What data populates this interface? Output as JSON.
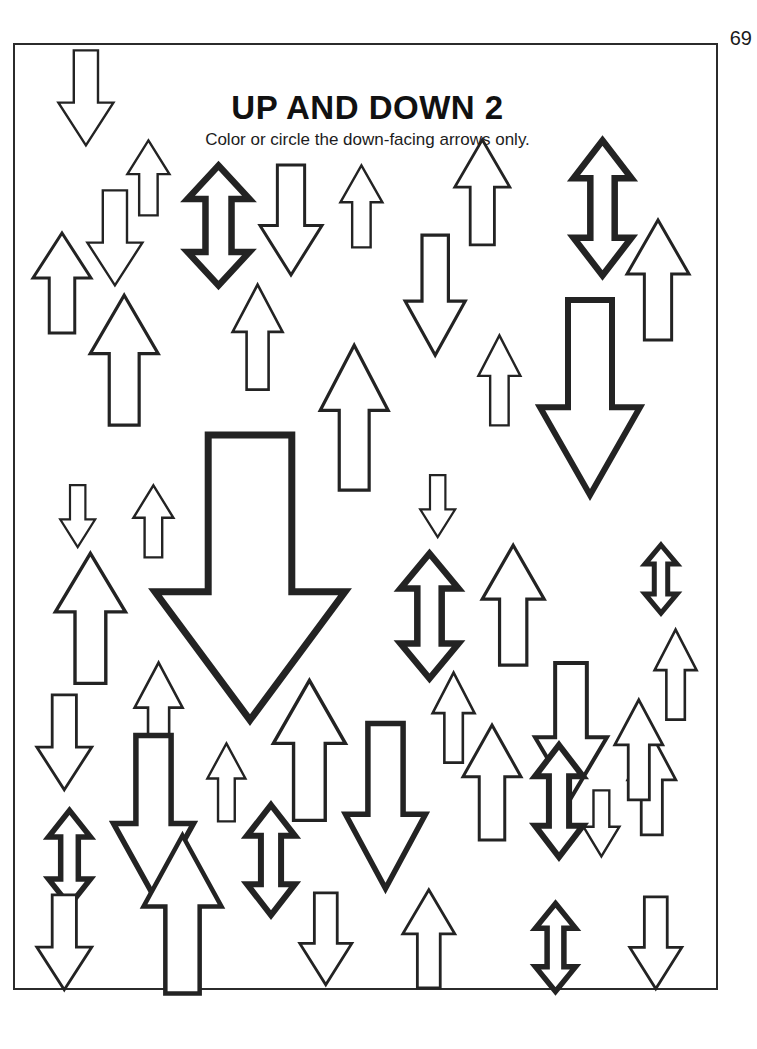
{
  "page": {
    "number": "69",
    "title": "UP AND DOWN 2",
    "subtitle": "Color or circle the down-facing arrows only.",
    "border_color": "#2b2b2b",
    "ink_color": "#232323",
    "paper_color": "#ffffff"
  },
  "worksheet": {
    "instruction_task": "Color or circle the down-facing arrows only.",
    "arrow_kinds": [
      "up",
      "down",
      "double"
    ],
    "stroke_weights": {
      "thin": 2.4,
      "bold": 6.5
    },
    "counts": {
      "up": 30,
      "down": 24,
      "double": 7,
      "total": 61
    },
    "arrows": [
      {
        "name": "arrow-down-01",
        "dir": "down",
        "x": 43,
        "y": 5,
        "w": 55,
        "h": 95,
        "stroke": 2.4
      },
      {
        "name": "arrow-up-02",
        "dir": "up",
        "x": 112,
        "y": 95,
        "w": 42,
        "h": 75,
        "stroke": 2.4
      },
      {
        "name": "arrow-down-03",
        "dir": "down",
        "x": 72,
        "y": 145,
        "w": 55,
        "h": 95,
        "stroke": 2.4
      },
      {
        "name": "arrow-up-04",
        "dir": "up",
        "x": 18,
        "y": 188,
        "w": 58,
        "h": 100,
        "stroke": 3.0
      },
      {
        "name": "arrow-double-05",
        "dir": "double",
        "x": 172,
        "y": 120,
        "w": 62,
        "h": 120,
        "stroke": 6.5
      },
      {
        "name": "arrow-down-06",
        "dir": "down",
        "x": 245,
        "y": 120,
        "w": 62,
        "h": 110,
        "stroke": 3.0
      },
      {
        "name": "arrow-up-07",
        "dir": "up",
        "x": 325,
        "y": 120,
        "w": 42,
        "h": 82,
        "stroke": 2.4
      },
      {
        "name": "arrow-up-08",
        "dir": "up",
        "x": 440,
        "y": 95,
        "w": 55,
        "h": 105,
        "stroke": 2.8
      },
      {
        "name": "arrow-double-09",
        "dir": "double",
        "x": 558,
        "y": 95,
        "w": 58,
        "h": 135,
        "stroke": 6.5
      },
      {
        "name": "arrow-up-10",
        "dir": "up",
        "x": 612,
        "y": 175,
        "w": 62,
        "h": 120,
        "stroke": 3.0
      },
      {
        "name": "arrow-up-11",
        "dir": "up",
        "x": 75,
        "y": 250,
        "w": 68,
        "h": 130,
        "stroke": 3.2
      },
      {
        "name": "arrow-up-12",
        "dir": "up",
        "x": 218,
        "y": 240,
        "w": 50,
        "h": 105,
        "stroke": 2.6
      },
      {
        "name": "arrow-down-13",
        "dir": "down",
        "x": 390,
        "y": 190,
        "w": 60,
        "h": 120,
        "stroke": 3.2
      },
      {
        "name": "arrow-up-14",
        "dir": "up",
        "x": 305,
        "y": 300,
        "w": 68,
        "h": 145,
        "stroke": 3.2
      },
      {
        "name": "arrow-up-15",
        "dir": "up",
        "x": 463,
        "y": 290,
        "w": 42,
        "h": 90,
        "stroke": 2.4
      },
      {
        "name": "arrow-down-16",
        "dir": "down",
        "x": 525,
        "y": 255,
        "w": 100,
        "h": 195,
        "stroke": 6.0
      },
      {
        "name": "arrow-down-17",
        "dir": "down",
        "x": 45,
        "y": 440,
        "w": 35,
        "h": 62,
        "stroke": 2.2
      },
      {
        "name": "arrow-up-18",
        "dir": "up",
        "x": 118,
        "y": 440,
        "w": 40,
        "h": 72,
        "stroke": 2.4
      },
      {
        "name": "arrow-down-19",
        "dir": "down",
        "x": 405,
        "y": 430,
        "w": 35,
        "h": 62,
        "stroke": 2.2
      },
      {
        "name": "arrow-double-20",
        "dir": "double",
        "x": 630,
        "y": 500,
        "w": 32,
        "h": 68,
        "stroke": 5.0
      },
      {
        "name": "arrow-down-21",
        "dir": "down",
        "x": 140,
        "y": 390,
        "w": 190,
        "h": 285,
        "stroke": 7.0
      },
      {
        "name": "arrow-up-22",
        "dir": "up",
        "x": 40,
        "y": 508,
        "w": 70,
        "h": 130,
        "stroke": 3.4
      },
      {
        "name": "arrow-double-23",
        "dir": "double",
        "x": 385,
        "y": 508,
        "w": 58,
        "h": 125,
        "stroke": 6.5
      },
      {
        "name": "arrow-up-24",
        "dir": "up",
        "x": 467,
        "y": 500,
        "w": 62,
        "h": 120,
        "stroke": 3.2
      },
      {
        "name": "arrow-up-25",
        "dir": "up",
        "x": 640,
        "y": 585,
        "w": 42,
        "h": 90,
        "stroke": 2.6
      },
      {
        "name": "arrow-down-26",
        "dir": "down",
        "x": 22,
        "y": 650,
        "w": 55,
        "h": 95,
        "stroke": 2.8
      },
      {
        "name": "arrow-up-27",
        "dir": "up",
        "x": 120,
        "y": 618,
        "w": 48,
        "h": 100,
        "stroke": 2.6
      },
      {
        "name": "arrow-up-28",
        "dir": "up",
        "x": 258,
        "y": 635,
        "w": 72,
        "h": 140,
        "stroke": 3.4
      },
      {
        "name": "arrow-up-29",
        "dir": "up",
        "x": 192,
        "y": 698,
        "w": 38,
        "h": 78,
        "stroke": 2.4
      },
      {
        "name": "arrow-up-30",
        "dir": "up",
        "x": 418,
        "y": 628,
        "w": 42,
        "h": 90,
        "stroke": 2.6
      },
      {
        "name": "arrow-down-31",
        "dir": "down",
        "x": 520,
        "y": 618,
        "w": 72,
        "h": 135,
        "stroke": 4.0
      },
      {
        "name": "arrow-up-32",
        "dir": "up",
        "x": 613,
        "y": 690,
        "w": 48,
        "h": 100,
        "stroke": 2.8
      },
      {
        "name": "arrow-double-33",
        "dir": "double",
        "x": 33,
        "y": 765,
        "w": 42,
        "h": 95,
        "stroke": 5.5
      },
      {
        "name": "arrow-down-34",
        "dir": "down",
        "x": 98,
        "y": 690,
        "w": 80,
        "h": 160,
        "stroke": 5.5
      },
      {
        "name": "arrow-double-35",
        "dir": "double",
        "x": 232,
        "y": 760,
        "w": 48,
        "h": 110,
        "stroke": 6.0
      },
      {
        "name": "arrow-down-36",
        "dir": "down",
        "x": 330,
        "y": 678,
        "w": 80,
        "h": 165,
        "stroke": 5.5
      },
      {
        "name": "arrow-up-37",
        "dir": "up",
        "x": 448,
        "y": 680,
        "w": 58,
        "h": 115,
        "stroke": 3.0
      },
      {
        "name": "arrow-double-38",
        "dir": "double",
        "x": 520,
        "y": 700,
        "w": 48,
        "h": 112,
        "stroke": 6.0
      },
      {
        "name": "arrow-up-39",
        "dir": "up",
        "x": 600,
        "y": 655,
        "w": 48,
        "h": 100,
        "stroke": 2.8
      },
      {
        "name": "arrow-down-40",
        "dir": "down",
        "x": 568,
        "y": 745,
        "w": 36,
        "h": 66,
        "stroke": 2.4
      },
      {
        "name": "arrow-up-41",
        "dir": "up",
        "x": 128,
        "y": 790,
        "w": 78,
        "h": 158,
        "stroke": 4.5
      },
      {
        "name": "arrow-down-42",
        "dir": "down",
        "x": 22,
        "y": 850,
        "w": 55,
        "h": 95,
        "stroke": 2.8
      },
      {
        "name": "arrow-down-43",
        "dir": "down",
        "x": 285,
        "y": 848,
        "w": 52,
        "h": 92,
        "stroke": 2.8
      },
      {
        "name": "arrow-up-44",
        "dir": "up",
        "x": 388,
        "y": 845,
        "w": 52,
        "h": 98,
        "stroke": 2.8
      },
      {
        "name": "arrow-double-45",
        "dir": "double",
        "x": 520,
        "y": 858,
        "w": 40,
        "h": 88,
        "stroke": 5.5
      },
      {
        "name": "arrow-down-46",
        "dir": "down",
        "x": 615,
        "y": 852,
        "w": 52,
        "h": 92,
        "stroke": 2.8
      }
    ]
  }
}
